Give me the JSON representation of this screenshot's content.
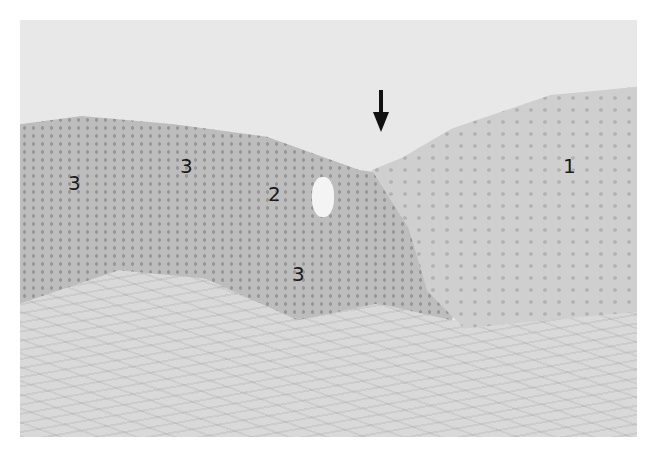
{
  "figure": {
    "type": "histology-micrograph",
    "labels": [
      {
        "id": "1",
        "text": "1"
      },
      {
        "id": "2",
        "text": "2"
      },
      {
        "id": "3a",
        "text": "3"
      },
      {
        "id": "3b",
        "text": "3"
      },
      {
        "id": "3c",
        "text": "3"
      }
    ],
    "annotation": {
      "arrow": "down-arrow"
    },
    "colors": {
      "background": "#ffffff",
      "lumen": "#e8e8e8",
      "epithelium": "#bdbdbd",
      "stroma": "#d9d9d9",
      "label": "#1a1a1a"
    }
  }
}
